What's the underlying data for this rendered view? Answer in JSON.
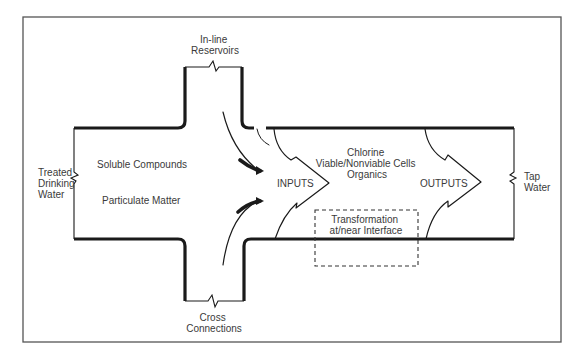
{
  "diagram": {
    "colors": {
      "line": "#1a1a1a",
      "frame": "#555555",
      "text": "#3a3a3a",
      "background": "#ffffff"
    },
    "labels": {
      "inline_reservoirs": [
        "In-line",
        "Reservoirs"
      ],
      "cross_connections": [
        "Cross",
        "Connections"
      ],
      "treated_drinking_water": [
        "Treated",
        "Drinking",
        "Water"
      ],
      "tap_water": [
        "Tap",
        "Water"
      ],
      "soluble_compounds": "Soluble Compounds",
      "particulate_matter": "Particulate Matter",
      "inputs": "INPUTS",
      "outputs": "OUTPUTS",
      "constituents": [
        "Chlorine",
        "Viable/Nonviable Cells",
        "Organics"
      ],
      "transformation": [
        "Transformation",
        "at/near Interface"
      ]
    },
    "nodes": [
      {
        "id": "treated-drinking-water",
        "label": "Treated Drinking Water",
        "role": "source"
      },
      {
        "id": "inline-reservoirs",
        "label": "In-line Reservoirs",
        "role": "branch"
      },
      {
        "id": "cross-connections",
        "label": "Cross Connections",
        "role": "branch"
      },
      {
        "id": "inputs",
        "label": "INPUTS",
        "role": "flow-arrow"
      },
      {
        "id": "outputs",
        "label": "OUTPUTS",
        "role": "flow-arrow"
      },
      {
        "id": "transformation",
        "label": "Transformation at/near Interface",
        "role": "process"
      },
      {
        "id": "tap-water",
        "label": "Tap Water",
        "role": "sink"
      }
    ],
    "edges": [
      {
        "from": "treated-drinking-water",
        "to": "inputs"
      },
      {
        "from": "inline-reservoirs",
        "to": "inputs"
      },
      {
        "from": "cross-connections",
        "to": "inputs"
      },
      {
        "from": "inputs",
        "to": "outputs"
      },
      {
        "from": "outputs",
        "to": "tap-water"
      }
    ]
  }
}
